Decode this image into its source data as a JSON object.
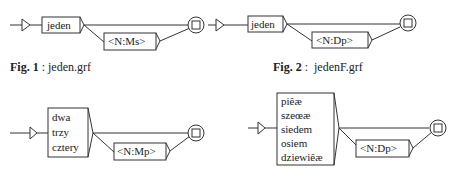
{
  "figures": [
    {
      "id": "fig1",
      "caption_label": "Fig. 1",
      "caption_sep": " : ",
      "caption_file": "jeden.grf",
      "main_box": [
        "jeden"
      ],
      "optional_box": "<N:Ms>"
    },
    {
      "id": "fig2",
      "caption_label": "Fig. 2",
      "caption_sep": " :  ",
      "caption_file": "jedenF.grf",
      "main_box": [
        "jeden"
      ],
      "optional_box": "<N:Dp>"
    },
    {
      "id": "fig3",
      "main_box": [
        "dwa",
        "trzy",
        "cztery"
      ],
      "optional_box": "<N:Mp>"
    },
    {
      "id": "fig4",
      "main_box": [
        "piêæ",
        "szeœæ",
        "siedem",
        "osiem",
        "dziewiêæ"
      ],
      "optional_box": "<N:Dp>"
    }
  ],
  "colors": {
    "line": "#333333",
    "background": "#ffffff"
  }
}
